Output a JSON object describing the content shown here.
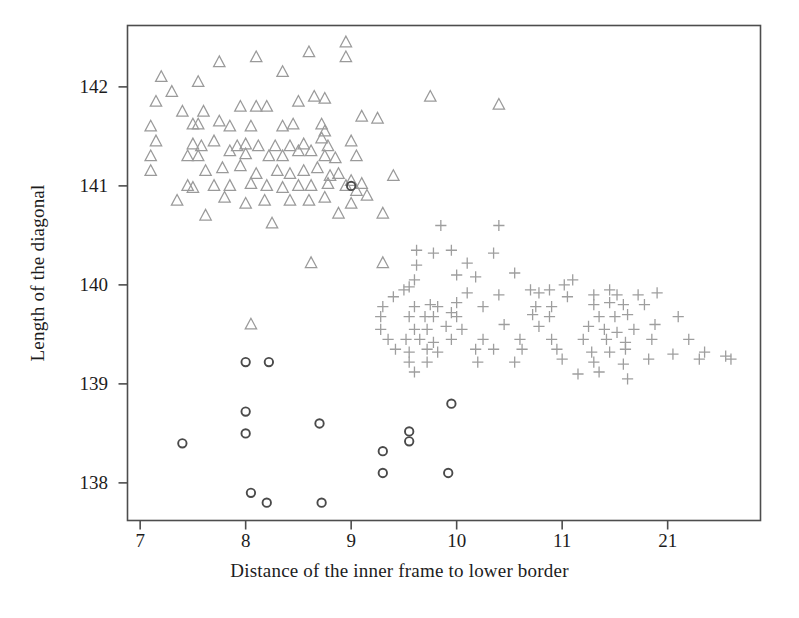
{
  "chart_data": {
    "type": "scatter",
    "title": "",
    "xlabel": "Distance of the inner frame to lower border",
    "ylabel": "Length of the diagonal",
    "xlim": [
      6.88,
      12.88
    ],
    "ylim": [
      137.62,
      142.62
    ],
    "xticks": [
      7,
      8,
      9,
      10,
      11,
      12
    ],
    "xticklabels": [
      "7",
      "8",
      "9",
      "10",
      "11",
      "21"
    ],
    "yticks": [
      138,
      139,
      140,
      141,
      142
    ],
    "yticklabels": [
      "138",
      "139",
      "140",
      "141",
      "142"
    ],
    "grid": false,
    "legend": "none",
    "series": [
      {
        "name": "triangle-group",
        "marker": "triangle-up",
        "color": "#9a9a9a",
        "points": [
          [
            7.2,
            142.1
          ],
          [
            7.3,
            141.95
          ],
          [
            7.55,
            142.05
          ],
          [
            7.75,
            142.25
          ],
          [
            8.1,
            142.3
          ],
          [
            8.35,
            142.15
          ],
          [
            8.6,
            142.35
          ],
          [
            8.95,
            142.45
          ],
          [
            8.95,
            142.3
          ],
          [
            7.15,
            141.85
          ],
          [
            7.4,
            141.75
          ],
          [
            7.6,
            141.75
          ],
          [
            7.95,
            141.8
          ],
          [
            8.1,
            141.8
          ],
          [
            8.2,
            141.8
          ],
          [
            8.5,
            141.85
          ],
          [
            8.65,
            141.9
          ],
          [
            8.75,
            141.88
          ],
          [
            9.75,
            141.9
          ],
          [
            10.4,
            141.82
          ],
          [
            7.1,
            141.6
          ],
          [
            7.5,
            141.62
          ],
          [
            7.55,
            141.62
          ],
          [
            7.75,
            141.65
          ],
          [
            7.85,
            141.6
          ],
          [
            8.05,
            141.6
          ],
          [
            8.35,
            141.6
          ],
          [
            8.45,
            141.62
          ],
          [
            8.72,
            141.62
          ],
          [
            8.75,
            141.55
          ],
          [
            9.1,
            141.7
          ],
          [
            9.25,
            141.68
          ],
          [
            7.15,
            141.45
          ],
          [
            7.5,
            141.42
          ],
          [
            7.58,
            141.4
          ],
          [
            7.7,
            141.45
          ],
          [
            7.92,
            141.4
          ],
          [
            8.0,
            141.42
          ],
          [
            8.12,
            141.4
          ],
          [
            8.28,
            141.4
          ],
          [
            8.42,
            141.4
          ],
          [
            8.55,
            141.42
          ],
          [
            8.72,
            141.48
          ],
          [
            8.78,
            141.4
          ],
          [
            9.0,
            141.45
          ],
          [
            7.1,
            141.3
          ],
          [
            7.45,
            141.3
          ],
          [
            7.55,
            141.3
          ],
          [
            7.85,
            141.35
          ],
          [
            8.0,
            141.32
          ],
          [
            8.22,
            141.3
          ],
          [
            8.35,
            141.3
          ],
          [
            8.5,
            141.35
          ],
          [
            8.62,
            141.35
          ],
          [
            8.75,
            141.3
          ],
          [
            8.85,
            141.28
          ],
          [
            9.05,
            141.3
          ],
          [
            7.1,
            141.15
          ],
          [
            7.62,
            141.15
          ],
          [
            7.78,
            141.18
          ],
          [
            7.95,
            141.2
          ],
          [
            8.1,
            141.12
          ],
          [
            8.3,
            141.15
          ],
          [
            8.42,
            141.12
          ],
          [
            8.55,
            141.15
          ],
          [
            8.68,
            141.18
          ],
          [
            8.8,
            141.1
          ],
          [
            8.88,
            141.12
          ],
          [
            9.0,
            141.05
          ],
          [
            9.1,
            141.02
          ],
          [
            7.45,
            141.0
          ],
          [
            7.5,
            140.98
          ],
          [
            7.7,
            141.0
          ],
          [
            7.85,
            141.0
          ],
          [
            8.05,
            141.02
          ],
          [
            8.2,
            141.0
          ],
          [
            8.35,
            140.98
          ],
          [
            8.5,
            141.0
          ],
          [
            8.62,
            141.0
          ],
          [
            8.78,
            141.02
          ],
          [
            8.95,
            141.0
          ],
          [
            9.05,
            140.95
          ],
          [
            9.4,
            141.1
          ],
          [
            7.35,
            140.85
          ],
          [
            7.8,
            140.88
          ],
          [
            8.0,
            140.82
          ],
          [
            8.18,
            140.85
          ],
          [
            8.42,
            140.85
          ],
          [
            8.6,
            140.85
          ],
          [
            8.75,
            140.88
          ],
          [
            9.0,
            140.82
          ],
          [
            9.15,
            140.9
          ],
          [
            7.62,
            140.7
          ],
          [
            8.25,
            140.62
          ],
          [
            8.88,
            140.72
          ],
          [
            9.3,
            140.72
          ],
          [
            8.05,
            139.6
          ],
          [
            8.62,
            140.22
          ],
          [
            9.3,
            140.22
          ]
        ]
      },
      {
        "name": "plus-group",
        "marker": "plus",
        "color": "#9e9e9e",
        "points": [
          [
            9.85,
            140.6
          ],
          [
            10.4,
            140.6
          ],
          [
            9.62,
            140.35
          ],
          [
            9.78,
            140.32
          ],
          [
            9.95,
            140.35
          ],
          [
            10.35,
            140.32
          ],
          [
            9.62,
            140.2
          ],
          [
            10.1,
            140.22
          ],
          [
            9.6,
            140.05
          ],
          [
            10.0,
            140.1
          ],
          [
            10.18,
            140.08
          ],
          [
            10.55,
            140.12
          ],
          [
            11.1,
            140.05
          ],
          [
            11.02,
            140.0
          ],
          [
            9.5,
            139.95
          ],
          [
            9.55,
            139.98
          ],
          [
            9.4,
            139.88
          ],
          [
            10.1,
            139.92
          ],
          [
            10.4,
            139.9
          ],
          [
            10.7,
            139.95
          ],
          [
            10.78,
            139.92
          ],
          [
            10.88,
            139.95
          ],
          [
            11.05,
            139.88
          ],
          [
            11.3,
            139.9
          ],
          [
            11.45,
            139.95
          ],
          [
            11.52,
            139.9
          ],
          [
            11.72,
            139.9
          ],
          [
            11.9,
            139.92
          ],
          [
            9.3,
            139.78
          ],
          [
            9.6,
            139.78
          ],
          [
            9.75,
            139.8
          ],
          [
            9.82,
            139.78
          ],
          [
            10.0,
            139.82
          ],
          [
            10.25,
            139.78
          ],
          [
            10.75,
            139.78
          ],
          [
            10.9,
            139.78
          ],
          [
            11.3,
            139.8
          ],
          [
            11.45,
            139.82
          ],
          [
            11.58,
            139.8
          ],
          [
            11.78,
            139.8
          ],
          [
            9.28,
            139.68
          ],
          [
            9.55,
            139.68
          ],
          [
            9.7,
            139.68
          ],
          [
            9.78,
            139.68
          ],
          [
            9.95,
            139.72
          ],
          [
            10.0,
            139.68
          ],
          [
            10.72,
            139.7
          ],
          [
            10.88,
            139.68
          ],
          [
            11.35,
            139.68
          ],
          [
            11.5,
            139.68
          ],
          [
            11.62,
            139.7
          ],
          [
            12.1,
            139.68
          ],
          [
            9.28,
            139.55
          ],
          [
            9.6,
            139.55
          ],
          [
            9.72,
            139.55
          ],
          [
            9.9,
            139.58
          ],
          [
            10.05,
            139.55
          ],
          [
            10.45,
            139.6
          ],
          [
            10.78,
            139.58
          ],
          [
            11.25,
            139.58
          ],
          [
            11.4,
            139.55
          ],
          [
            11.52,
            139.52
          ],
          [
            11.68,
            139.55
          ],
          [
            11.88,
            139.6
          ],
          [
            9.35,
            139.45
          ],
          [
            9.52,
            139.45
          ],
          [
            9.65,
            139.45
          ],
          [
            9.78,
            139.42
          ],
          [
            9.95,
            139.45
          ],
          [
            10.25,
            139.45
          ],
          [
            10.6,
            139.45
          ],
          [
            10.9,
            139.45
          ],
          [
            11.2,
            139.45
          ],
          [
            11.42,
            139.45
          ],
          [
            11.6,
            139.42
          ],
          [
            11.85,
            139.45
          ],
          [
            12.2,
            139.45
          ],
          [
            9.42,
            139.35
          ],
          [
            9.55,
            139.32
          ],
          [
            9.72,
            139.35
          ],
          [
            9.82,
            139.32
          ],
          [
            10.18,
            139.35
          ],
          [
            10.35,
            139.35
          ],
          [
            10.62,
            139.35
          ],
          [
            10.95,
            139.35
          ],
          [
            11.28,
            139.32
          ],
          [
            11.45,
            139.32
          ],
          [
            11.6,
            139.35
          ],
          [
            12.05,
            139.3
          ],
          [
            12.35,
            139.32
          ],
          [
            12.55,
            139.28
          ],
          [
            9.55,
            139.22
          ],
          [
            9.72,
            139.22
          ],
          [
            10.2,
            139.22
          ],
          [
            10.55,
            139.22
          ],
          [
            11.0,
            139.25
          ],
          [
            11.3,
            139.22
          ],
          [
            11.58,
            139.2
          ],
          [
            11.82,
            139.25
          ],
          [
            12.3,
            139.25
          ],
          [
            12.6,
            139.25
          ],
          [
            9.6,
            139.12
          ],
          [
            11.15,
            139.1
          ],
          [
            11.35,
            139.12
          ],
          [
            11.62,
            139.05
          ]
        ]
      },
      {
        "name": "circle-group",
        "marker": "circle",
        "color": "#4a4a4a",
        "points": [
          [
            8.0,
            139.22
          ],
          [
            8.22,
            139.22
          ],
          [
            9.0,
            141.0
          ],
          [
            8.0,
            138.72
          ],
          [
            8.0,
            138.5
          ],
          [
            8.7,
            138.6
          ],
          [
            9.95,
            138.8
          ],
          [
            9.55,
            138.52
          ],
          [
            9.55,
            138.42
          ],
          [
            7.4,
            138.4
          ],
          [
            9.3,
            138.32
          ],
          [
            9.3,
            138.1
          ],
          [
            9.92,
            138.1
          ],
          [
            8.05,
            137.9
          ],
          [
            8.2,
            137.8
          ],
          [
            8.72,
            137.8
          ]
        ]
      }
    ]
  },
  "axes": {
    "frame_color": "#4d4d4d",
    "background": "#ffffff",
    "x_tick_label_names": [
      "xtick-7",
      "xtick-8",
      "xtick-9",
      "xtick-10",
      "xtick-11",
      "xtick-21"
    ],
    "y_tick_label_names": [
      "ytick-142",
      "ytick-141",
      "ytick-140",
      "ytick-139",
      "ytick-138"
    ]
  }
}
